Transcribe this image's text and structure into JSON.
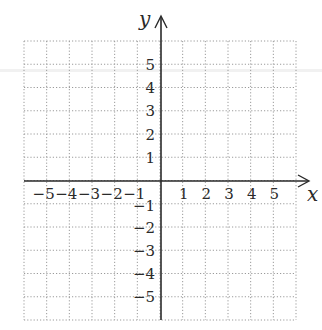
{
  "diagram": {
    "type": "coordinate-grid",
    "x_axis": {
      "label": "x",
      "ticks": [
        "-5",
        "-4",
        "-3",
        "-2",
        "-1",
        "1",
        "2",
        "3",
        "4",
        "5"
      ],
      "range": [
        -6,
        6
      ]
    },
    "y_axis": {
      "label": "y",
      "ticks": [
        "5",
        "4",
        "3",
        "2",
        "1",
        "-1",
        "-2",
        "-3",
        "-4",
        "-5"
      ],
      "range": [
        -6,
        6
      ]
    },
    "grid": {
      "style": "dotted",
      "cells": 12,
      "color": "#9a9a9a"
    },
    "axis_color": "#2a2a2a"
  }
}
